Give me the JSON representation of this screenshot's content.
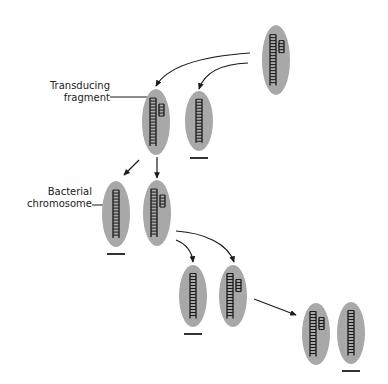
{
  "diagram": {
    "labels": {
      "transducing_fragment": [
        "Transducing",
        "fragment"
      ],
      "bacterial_chromosome": [
        "Bacterial",
        "chromosome"
      ]
    },
    "colors": {
      "cell_fill": "#a8a8a8",
      "ink": "#1a1a1a",
      "background": "#ffffff"
    },
    "cells": [
      {
        "id": "donor-top",
        "cx": 276,
        "cy": 60,
        "rx": 14,
        "ry": 35,
        "fragment": true,
        "underline": false
      },
      {
        "id": "gen1-left",
        "cx": 156,
        "cy": 122,
        "rx": 14,
        "ry": 33,
        "fragment": true,
        "underline": false
      },
      {
        "id": "gen1-right",
        "cx": 199,
        "cy": 121,
        "rx": 14,
        "ry": 30,
        "fragment": false,
        "underline": true
      },
      {
        "id": "gen2-left",
        "cx": 116,
        "cy": 214,
        "rx": 14,
        "ry": 33,
        "fragment": false,
        "underline": true
      },
      {
        "id": "gen2-right",
        "cx": 157,
        "cy": 213,
        "rx": 14,
        "ry": 33,
        "fragment": true,
        "underline": false
      },
      {
        "id": "gen3-left",
        "cx": 193,
        "cy": 296,
        "rx": 14,
        "ry": 31,
        "fragment": false,
        "underline": true
      },
      {
        "id": "gen3-right",
        "cx": 233,
        "cy": 296,
        "rx": 14,
        "ry": 31,
        "fragment": true,
        "underline": false
      },
      {
        "id": "gen4-left",
        "cx": 316,
        "cy": 334,
        "rx": 14,
        "ry": 31,
        "fragment": true,
        "underline": false
      },
      {
        "id": "gen4-right",
        "cx": 351,
        "cy": 333,
        "rx": 14,
        "ry": 31,
        "fragment": false,
        "underline": true
      }
    ]
  }
}
